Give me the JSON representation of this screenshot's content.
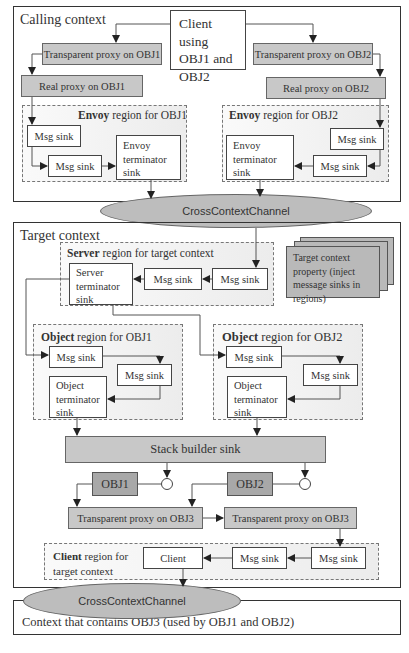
{
  "calling_context": {
    "label": "Calling context",
    "client": "Client using OBJ1 and OBJ2",
    "tp_obj1": "Transparent proxy on OBJ1",
    "tp_obj2": "Transparent proxy on OBJ2",
    "rp_obj1": "Real proxy on OBJ1",
    "rp_obj2": "Real proxy on OBJ2",
    "envoy1": {
      "label_bold": "Envoy",
      "label_rest": " region for OBJ1",
      "sink1": "Msg sink",
      "sink2": "Msg sink",
      "terminator": "Envoy terminator sink"
    },
    "envoy2": {
      "label_bold": "Envoy",
      "label_rest": " region for OBJ2",
      "sink1": "Msg sink",
      "sink2": "Msg sink",
      "terminator": "Envoy terminator sink"
    }
  },
  "channel1": "CrossContextChannel",
  "target_context": {
    "label": "Target context",
    "property": "Target context property (inject message sinks in regions)",
    "server": {
      "label_bold": "Server",
      "label_rest": " region for target context",
      "terminator": "Server terminator sink",
      "sink1": "Msg sink",
      "sink2": "Msg sink"
    },
    "object1": {
      "label_bold": "Object",
      "label_rest": " region for OBJ1",
      "sink1": "Msg sink",
      "sink2": "Msg sink",
      "terminator": "Object terminator sink"
    },
    "object2": {
      "label_bold": "Object",
      "label_rest": " region for OBJ2",
      "sink1": "Msg sink",
      "sink2": "Msg sink",
      "terminator": "Object terminator sink"
    },
    "stack_builder": "Stack builder sink",
    "obj1": "OBJ1",
    "obj2": "OBJ2",
    "tp_obj3_a": "Transparent proxy on OBJ3",
    "tp_obj3_b": "Transparent proxy on OBJ3",
    "client_region": {
      "label_bold": "Client",
      "label_rest": " region for target context",
      "client": "Client",
      "sink1": "Msg sink",
      "sink2": "Msg sink"
    }
  },
  "channel2": "CrossContextChannel",
  "obj3_context": "Context that contains OBJ3 (used by OBJ1 and OBJ2)"
}
